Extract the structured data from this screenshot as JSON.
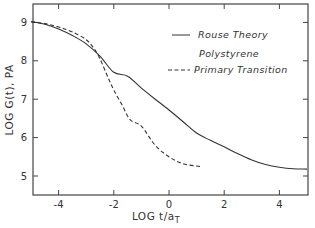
{
  "chart_data": {
    "type": "line",
    "title": "",
    "xlabel": "LOG t/a_T",
    "xlabel_main": "LOG t/a",
    "xlabel_sub": "T",
    "ylabel": "LOG G(t), PA",
    "xlim": [
      -5,
      5
    ],
    "ylim": [
      4.5,
      9.5
    ],
    "xticks": [
      -4,
      -2,
      0,
      2,
      4
    ],
    "xtick_labels": [
      "-4",
      "-2",
      "0",
      "2",
      "4"
    ],
    "yticks": [
      5,
      6,
      7,
      8,
      9
    ],
    "ytick_labels": [
      "5",
      "6",
      "7",
      "8",
      "9"
    ],
    "grid": false,
    "legend_position": "upper right",
    "legend": {
      "entries": [
        {
          "label": "Rouse Theory",
          "style": "solid"
        },
        {
          "heading": "Polystyrene",
          "label": "Primary Transition",
          "style": "dashed"
        }
      ]
    },
    "series": [
      {
        "name": "Rouse Theory",
        "style": "solid",
        "x": [
          -5.0,
          -4.5,
          -4.0,
          -3.5,
          -3.0,
          -2.5,
          -2.0,
          -1.5,
          -1.0,
          -0.5,
          0.0,
          0.5,
          1.0,
          1.5,
          2.0,
          2.5,
          3.0,
          3.5,
          4.0,
          4.5,
          5.0
        ],
        "y": [
          9.02,
          8.95,
          8.83,
          8.66,
          8.44,
          8.12,
          7.7,
          7.6,
          7.29,
          7.0,
          6.72,
          6.42,
          6.12,
          5.93,
          5.76,
          5.58,
          5.42,
          5.3,
          5.23,
          5.19,
          5.18
        ]
      },
      {
        "name": "Polystyrene Primary Transition",
        "style": "dashed",
        "x": [
          -5.0,
          -4.5,
          -4.0,
          -3.5,
          -3.0,
          -2.7,
          -2.5,
          -2.2,
          -2.0,
          -1.7,
          -1.4,
          -1.0,
          -0.5,
          0.0,
          0.5,
          1.0,
          1.2
        ],
        "y": [
          9.02,
          8.97,
          8.88,
          8.75,
          8.55,
          8.3,
          8.05,
          7.55,
          7.24,
          6.85,
          6.46,
          6.3,
          5.8,
          5.5,
          5.32,
          5.26,
          5.24
        ]
      }
    ]
  }
}
